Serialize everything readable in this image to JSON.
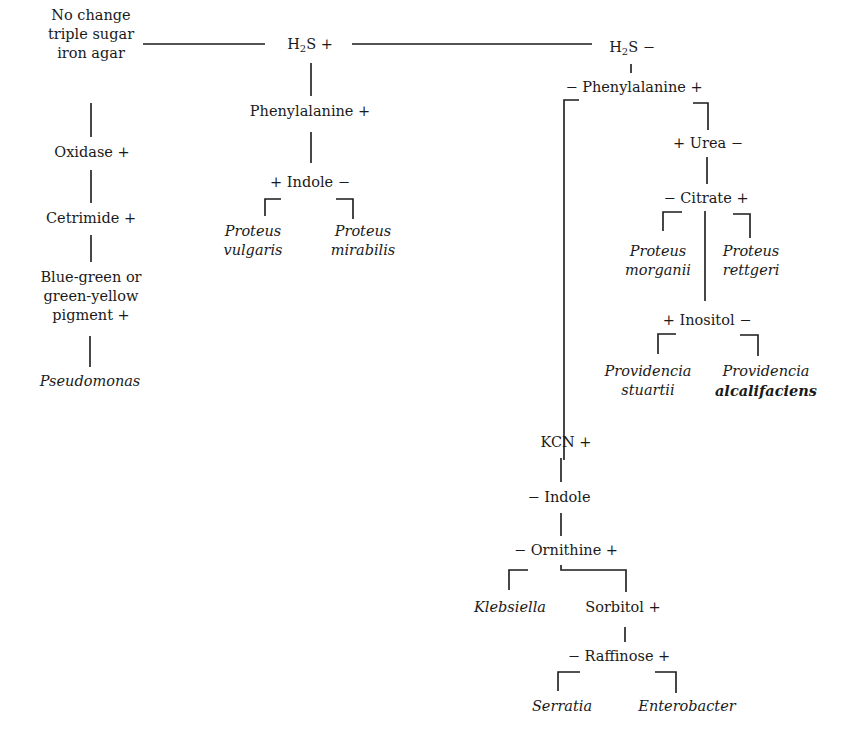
{
  "diagram": {
    "type": "dichotomous identification key (flowchart)",
    "root": {
      "label_lines": [
        "No change",
        "triple sugar",
        "iron agar"
      ]
    },
    "branches": {
      "h2s_pos": {
        "prefix": "H",
        "sub": "2",
        "suffix": "S +"
      },
      "h2s_neg": {
        "prefix": "H",
        "sub": "2",
        "suffix": "S −"
      }
    },
    "left_column": {
      "oxidase": "Oxidase +",
      "cetrimide": "Cetrimide +",
      "pigment_lines": [
        "Blue-green or",
        "green-yellow",
        "pigment +"
      ],
      "result": "Pseudomonas"
    },
    "h2s_pos_column": {
      "phenylalanine": "Phenylalanine +",
      "indole": "+ Indole −",
      "results": [
        {
          "genus": "Proteus",
          "species": "vulgaris"
        },
        {
          "genus": "Proteus",
          "species": "mirabilis"
        }
      ]
    },
    "h2s_neg_column": {
      "phenylalanine": "− Phenylalanine +",
      "urea": "+ Urea −",
      "citrate": "− Citrate +",
      "citrate_results": [
        {
          "genus": "Proteus",
          "species": "morganii"
        },
        {
          "genus": "Proteus",
          "species": "rettgeri"
        }
      ],
      "inositol": "+ Inositol −",
      "inositol_results": [
        {
          "genus": "Providencia",
          "species": "stuartii"
        },
        {
          "genus": "Providencia",
          "species": "alcalifaciens"
        }
      ],
      "kcn": "KCN +",
      "indole": "− Indole",
      "ornithine": "− Ornithine +",
      "ornithine_neg_result": "Klebsiella",
      "sorbitol": "Sorbitol +",
      "raffinose": "− Raffinose +",
      "raffinose_results": [
        "Serratia",
        "Enterobacter"
      ]
    },
    "line_color": "#1a1a1a",
    "background": "#ffffff"
  }
}
